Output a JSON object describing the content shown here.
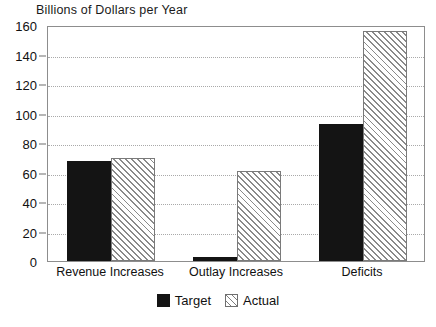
{
  "chart_data": {
    "type": "bar",
    "title": "Billions of Dollars per Year",
    "xlabel": "",
    "ylabel": "",
    "ylim": [
      0,
      160
    ],
    "yticks": [
      0,
      20,
      40,
      60,
      80,
      100,
      120,
      140,
      160
    ],
    "ytick_labels": [
      "0",
      "20",
      "40",
      "60",
      "80",
      "100",
      "120",
      "140",
      "160"
    ],
    "grid": true,
    "legend_position": "bottom-center",
    "categories": [
      "Revenue Increases",
      "Outlay Increases",
      "Deficits"
    ],
    "series": [
      {
        "name": "Target",
        "fill": "solid-black",
        "color": "#141414",
        "values": [
          68,
          3,
          93
        ]
      },
      {
        "name": "Actual",
        "fill": "diagonal-hatch",
        "color": "#8a8a8a",
        "values": [
          70,
          61,
          156
        ]
      }
    ]
  },
  "legend": {
    "items": [
      {
        "label": "Target",
        "swatch": "solid-black-swatch"
      },
      {
        "label": "Actual",
        "swatch": "hatched-swatch"
      }
    ]
  }
}
